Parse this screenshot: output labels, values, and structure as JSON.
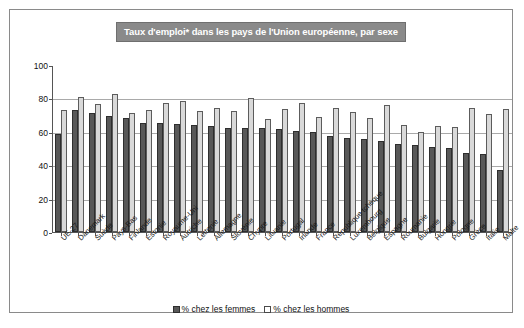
{
  "chart_data": {
    "type": "bar",
    "title": "Taux d'emploi* dans les pays de l'Union européenne, par sexe",
    "xlabel": "",
    "ylabel": "",
    "ylim": [
      0,
      100
    ],
    "yticks": [
      0,
      20,
      40,
      60,
      80,
      100
    ],
    "grid": true,
    "legend_position": "bottom",
    "categories": [
      "UE-27",
      "Danemark",
      "Suède",
      "Pays-Bas",
      "Finlande",
      "Estonie",
      "Royaume-Uni",
      "Autriche",
      "Lettonie",
      "Allemagne",
      "Slovénie",
      "Chypre",
      "Lituanie",
      "Portugal",
      "Irlande",
      "France",
      "République tchèque",
      "Luxembourg",
      "Belgique",
      "Espagne",
      "Roumanie",
      "Bulgarie",
      "Hongrie",
      "Pologne",
      "Grèce",
      "Italie",
      "Malte"
    ],
    "series": [
      {
        "name": "% chez les femmes",
        "color": "#585858",
        "values": [
          58.5,
          73.0,
          71.5,
          69.5,
          68.5,
          65.5,
          65.0,
          64.5,
          64.0,
          63.5,
          62.5,
          62.5,
          62.0,
          61.5,
          60.5,
          60.0,
          57.5,
          56.0,
          55.5,
          54.5,
          53.0,
          52.0,
          51.0,
          50.5,
          47.5,
          46.5,
          37.0
        ]
      },
      {
        "name": "% chez les hommes",
        "color": "#d9d9d9",
        "values": [
          73.0,
          81.0,
          76.5,
          82.5,
          71.5,
          73.0,
          77.5,
          78.5,
          72.5,
          74.5,
          72.5,
          80.0,
          67.5,
          73.5,
          77.5,
          69.0,
          74.5,
          72.0,
          68.5,
          76.0,
          64.0,
          60.0,
          63.5,
          63.0,
          74.5,
          70.5,
          73.5
        ]
      }
    ]
  },
  "legend": {
    "items": [
      {
        "label": "% chez les femmes"
      },
      {
        "label": "% chez les hommes"
      }
    ]
  }
}
